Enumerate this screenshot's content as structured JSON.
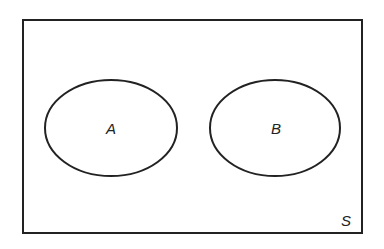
{
  "diagram": {
    "type": "venn",
    "universe": {
      "label": "S"
    },
    "sets": [
      {
        "label": "A"
      },
      {
        "label": "B"
      }
    ],
    "relationship": "disjoint",
    "colors": {
      "stroke": "#222222",
      "background": "#ffffff"
    }
  }
}
